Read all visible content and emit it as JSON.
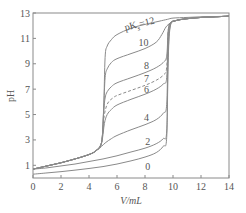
{
  "chart_data": {
    "type": "line",
    "title": "",
    "xlabel": "V/mL",
    "ylabel": "pH",
    "xlim": [
      0,
      14
    ],
    "ylim": [
      0,
      13
    ],
    "xticks": [
      0,
      2,
      4,
      6,
      8,
      10,
      12,
      14
    ],
    "yticks": [
      1,
      3,
      5,
      7,
      9,
      11,
      13
    ],
    "grid": false,
    "legend": "none (curves labeled inline)",
    "series": [
      {
        "name": "pKs=12",
        "label": "pK",
        "label_sub": "s",
        "label_suffix": "=12",
        "style": "solid",
        "x": [
          0,
          1,
          2,
          3,
          4,
          4.5,
          4.9,
          5.05,
          5.15,
          5.3,
          5.6,
          6,
          7,
          8,
          9,
          9.6,
          10,
          11,
          12,
          13,
          14
        ],
        "y": [
          0.7,
          0.95,
          1.2,
          1.5,
          1.85,
          2.15,
          2.8,
          5.5,
          9.5,
          10.4,
          10.9,
          11.3,
          11.8,
          12.1,
          12.35,
          12.5,
          12.6,
          12.65,
          12.7,
          12.72,
          12.75
        ]
      },
      {
        "name": "10",
        "label": "10",
        "style": "solid",
        "x": [
          0,
          1,
          2,
          3,
          4,
          4.5,
          4.9,
          5.05,
          5.15,
          5.3,
          5.6,
          6,
          7,
          8,
          8.8,
          9.2,
          9.5,
          9.8,
          10.2,
          11,
          12,
          13,
          14
        ],
        "y": [
          0.7,
          0.95,
          1.2,
          1.5,
          1.85,
          2.15,
          2.8,
          5.5,
          7.9,
          8.6,
          9.1,
          9.4,
          9.8,
          10.2,
          10.7,
          11.3,
          11.9,
          12.2,
          12.4,
          12.55,
          12.65,
          12.7,
          12.75
        ]
      },
      {
        "name": "8",
        "label": "8",
        "style": "solid",
        "x": [
          0,
          1,
          2,
          3,
          4,
          4.5,
          4.9,
          5.05,
          5.15,
          5.3,
          5.6,
          6,
          7,
          8,
          8.8,
          9.3,
          9.55,
          9.65,
          9.8,
          10.2,
          11,
          12,
          13,
          14
        ],
        "y": [
          0.7,
          0.95,
          1.2,
          1.5,
          1.85,
          2.15,
          2.8,
          5.2,
          6.3,
          6.8,
          7.2,
          7.5,
          7.9,
          8.3,
          8.7,
          9.1,
          9.6,
          11.5,
          12.2,
          12.4,
          12.55,
          12.65,
          12.7,
          12.75
        ]
      },
      {
        "name": "7",
        "label": "7",
        "style": "dashed",
        "x": [
          0,
          1,
          2,
          3,
          4,
          4.5,
          4.9,
          5.05,
          5.2,
          5.4,
          5.7,
          6,
          7,
          8,
          8.8,
          9.3,
          9.55,
          9.65,
          9.8,
          10.2,
          11,
          12,
          13,
          14
        ],
        "y": [
          0.7,
          0.95,
          1.2,
          1.5,
          1.85,
          2.15,
          2.8,
          4.6,
          5.5,
          6.0,
          6.3,
          6.5,
          6.9,
          7.3,
          7.7,
          8.1,
          8.7,
          11.5,
          12.2,
          12.4,
          12.55,
          12.65,
          12.7,
          12.75
        ]
      },
      {
        "name": "6",
        "label": "6",
        "style": "solid",
        "x": [
          0,
          1,
          2,
          3,
          4,
          4.5,
          4.9,
          5.1,
          5.3,
          5.6,
          6,
          7,
          8,
          8.8,
          9.3,
          9.55,
          9.65,
          9.8,
          10.2,
          11,
          12,
          13,
          14
        ],
        "y": [
          0.7,
          0.95,
          1.2,
          1.5,
          1.85,
          2.15,
          2.8,
          4.3,
          5.0,
          5.4,
          5.75,
          6.2,
          6.6,
          7.0,
          7.4,
          7.9,
          11.3,
          12.2,
          12.4,
          12.55,
          12.65,
          12.7,
          12.75
        ]
      },
      {
        "name": "4",
        "label": "4",
        "style": "solid",
        "x": [
          0,
          1,
          2,
          3,
          4,
          4.5,
          4.9,
          5.2,
          5.6,
          6,
          7,
          8,
          8.8,
          9.3,
          9.55,
          9.65,
          9.8,
          10.2,
          11,
          12,
          13,
          14
        ],
        "y": [
          0.7,
          0.95,
          1.2,
          1.5,
          1.85,
          2.15,
          2.5,
          2.8,
          3.1,
          3.35,
          3.8,
          4.2,
          4.6,
          5.1,
          5.8,
          10.5,
          12.1,
          12.4,
          12.55,
          12.65,
          12.7,
          12.75
        ]
      },
      {
        "name": "2",
        "label": "2",
        "style": "solid",
        "x": [
          0,
          1,
          2,
          3,
          4,
          5,
          6,
          7,
          8,
          8.8,
          9.3,
          9.55,
          9.65,
          9.8,
          10.2,
          11,
          12,
          13,
          14
        ],
        "y": [
          0.7,
          0.8,
          0.95,
          1.1,
          1.3,
          1.5,
          1.75,
          2.05,
          2.35,
          2.7,
          3.1,
          3.7,
          9.5,
          12.0,
          12.4,
          12.55,
          12.65,
          12.7,
          12.75
        ]
      },
      {
        "name": "0",
        "label": "0",
        "style": "solid",
        "x": [
          0,
          1,
          2,
          3,
          4,
          5,
          6,
          7,
          8,
          8.8,
          9.3,
          9.55,
          9.65,
          9.8,
          10.2,
          11,
          12,
          13,
          14
        ],
        "y": [
          0.3,
          0.4,
          0.5,
          0.62,
          0.75,
          0.9,
          1.1,
          1.35,
          1.65,
          2.0,
          2.5,
          3.2,
          9.0,
          11.9,
          12.4,
          12.55,
          12.65,
          12.7,
          12.75
        ]
      }
    ],
    "annotations": [
      {
        "text": "pKs=12",
        "at_x": 6.6,
        "at_y": 11.6
      },
      {
        "text": "10",
        "at_x": 7.9,
        "at_y": 10.4
      },
      {
        "text": "8",
        "at_x": 8.1,
        "at_y": 8.6
      },
      {
        "text": "7",
        "at_x": 8.1,
        "at_y": 7.6
      },
      {
        "text": "6",
        "at_x": 8.1,
        "at_y": 6.7
      },
      {
        "text": "4",
        "at_x": 8.1,
        "at_y": 4.5
      },
      {
        "text": "2",
        "at_x": 8.2,
        "at_y": 2.6
      },
      {
        "text": "0",
        "at_x": 8.2,
        "at_y": 0.6
      }
    ]
  }
}
